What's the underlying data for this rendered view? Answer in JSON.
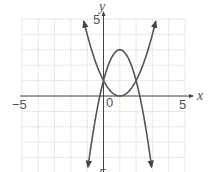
{
  "chart_data": {
    "type": "line",
    "title": "",
    "xlabel": "x",
    "ylabel": "y",
    "xlim": [
      -5,
      5
    ],
    "ylim": [
      -5,
      5
    ],
    "grid": true,
    "grid_style": "dotted",
    "tick_labels": {
      "x_min": "-5",
      "x_max": "5",
      "origin": "0",
      "y_max": "5",
      "y_min": "-5"
    },
    "series": [
      {
        "name": "upward parabola",
        "equation": "y = (x - 1)^2",
        "vertex": [
          1,
          0
        ],
        "x_range": [
          -1.2,
          3.2
        ],
        "points": [
          [
            -1.2,
            4.84
          ],
          [
            -1,
            4
          ],
          [
            0,
            1
          ],
          [
            1,
            0
          ],
          [
            2,
            1
          ],
          [
            3,
            4
          ],
          [
            3.2,
            4.84
          ]
        ],
        "arrows": "both ends"
      },
      {
        "name": "downward parabola",
        "equation": "y = -2(x - 1)^2 + 3",
        "vertex": [
          1,
          3
        ],
        "x_range": [
          -0.95,
          2.95
        ],
        "points": [
          [
            -0.95,
            -4.6
          ],
          [
            0,
            1
          ],
          [
            1,
            3
          ],
          [
            2,
            1
          ],
          [
            2.95,
            -4.6
          ]
        ],
        "arrows": "both ends"
      }
    ],
    "intersections": [
      [
        0,
        1
      ],
      [
        2,
        1
      ]
    ]
  },
  "labels": {
    "x_axis": "x",
    "y_axis": "y",
    "x_min": "−5",
    "x_max": "5",
    "origin": "0",
    "y_max": "5",
    "y_min": "−5"
  },
  "colors": {
    "curve": "#555555",
    "axis": "#444444",
    "grid": "#c8c8c8"
  }
}
